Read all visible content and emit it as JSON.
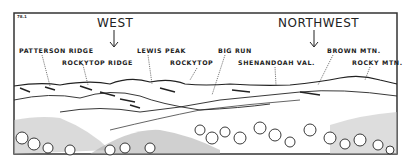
{
  "figure": {
    "number": "78.1",
    "directions": [
      {
        "label": "WEST"
      },
      {
        "label": "NORTHWEST"
      }
    ],
    "peaks": [
      {
        "label": "PATTERSON RIDGE"
      },
      {
        "label": "ROCKYTOP RIDGE"
      },
      {
        "label": "LEWIS PEAK"
      },
      {
        "label": "ROCKYTOP"
      },
      {
        "label": "BIG RUN"
      },
      {
        "label": "SHENANDOAH VAL."
      },
      {
        "label": "BROWN MTN."
      },
      {
        "label": "ROCKY MTN."
      }
    ],
    "colors": {
      "ink": "#222222",
      "paper": "#ffffff"
    }
  }
}
